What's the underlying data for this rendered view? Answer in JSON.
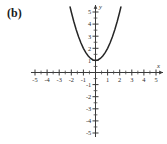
{
  "figure": {
    "part_label": "(b)",
    "background_color": "#ffffff",
    "curve_color": "#262626",
    "axis_color": "#3a3a3a"
  },
  "chart_data": {
    "type": "line",
    "title": "",
    "subtitle": "",
    "xlabel": "x",
    "ylabel": "y",
    "equation": "y = x^2 + 1",
    "grid": false,
    "legend": null,
    "xlim": [
      -5,
      5
    ],
    "ylim": [
      -5,
      5
    ],
    "x_ticks": [
      -5,
      -4,
      -3,
      -2,
      -1,
      1,
      2,
      3,
      4,
      5
    ],
    "y_ticks": [
      5,
      4,
      3,
      2,
      1,
      -1,
      -2,
      -3,
      -4,
      -5
    ],
    "x_tick_labels": [
      "-5",
      "-4",
      "-3",
      "-2",
      "-1",
      "1",
      "2",
      "3",
      "4",
      "5"
    ],
    "y_tick_labels": [
      "5",
      "4",
      "3",
      "2",
      "1",
      "-1",
      "-2",
      "-3",
      "-4",
      "-5"
    ],
    "minor_tick_step": 0.5,
    "vertex": [
      0,
      1
    ],
    "x": [
      -2.1,
      -2.0,
      -1.8,
      -1.6,
      -1.4,
      -1.2,
      -1.0,
      -0.8,
      -0.6,
      -0.4,
      -0.2,
      0.0,
      0.2,
      0.4,
      0.6,
      0.8,
      1.0,
      1.2,
      1.4,
      1.6,
      1.8,
      2.0,
      2.1
    ],
    "values": [
      5.41,
      5.0,
      4.24,
      3.56,
      2.96,
      2.44,
      2.0,
      1.64,
      1.36,
      1.16,
      1.04,
      1.0,
      1.04,
      1.16,
      1.36,
      1.64,
      2.0,
      2.44,
      2.96,
      3.56,
      4.24,
      5.0,
      5.41
    ],
    "series": [
      {
        "name": "y = x^2 + 1",
        "values": [
          5.41,
          5.0,
          4.24,
          3.56,
          2.96,
          2.44,
          2.0,
          1.64,
          1.36,
          1.16,
          1.04,
          1.0,
          1.04,
          1.16,
          1.36,
          1.64,
          2.0,
          2.44,
          2.96,
          3.56,
          4.24,
          5.0,
          5.41
        ]
      }
    ]
  }
}
